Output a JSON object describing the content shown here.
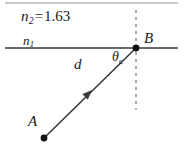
{
  "figure": {
    "type": "optics-refraction-diagram",
    "width": 185,
    "height": 153,
    "background": "#ffffff"
  },
  "labels": {
    "medium_upper_symbol": "n",
    "medium_upper_subscript": "2",
    "medium_upper_equals": "=",
    "medium_upper_value": "1.63",
    "medium_lower_symbol": "n",
    "medium_lower_subscript": "1",
    "distance": "d",
    "angle_symbol": "θ",
    "angle_subscript": "c",
    "point_b": "B",
    "point_a": "A"
  },
  "colors": {
    "ink": "#1a1a1a",
    "interface_line": "#6b6b6b",
    "top_rule": "#b8b8b8",
    "dashed_line": "#8a8a8a",
    "ray": "#3a3a3a",
    "dot": "#111111"
  },
  "geometry": {
    "top_rule": {
      "x1": 5,
      "y1": 3,
      "x2": 178,
      "y2": 3,
      "width": 1.4
    },
    "interface_line": {
      "x1": 5,
      "y1": 48,
      "x2": 178,
      "y2": 48,
      "width": 2.2
    },
    "normal_dashed": {
      "x": 136,
      "y1": 10,
      "y2": 110,
      "width": 1.4,
      "dash": "3 4"
    },
    "ray": {
      "x1": 44,
      "y1": 138,
      "x2": 136,
      "y2": 48,
      "width": 1.6
    },
    "arrowhead": {
      "x": 88,
      "y": 94,
      "size": 7
    },
    "point_a_dot": {
      "cx": 44,
      "cy": 138,
      "r": 3.4
    },
    "point_b_dot": {
      "cx": 136,
      "cy": 48,
      "r": 3.4
    }
  }
}
